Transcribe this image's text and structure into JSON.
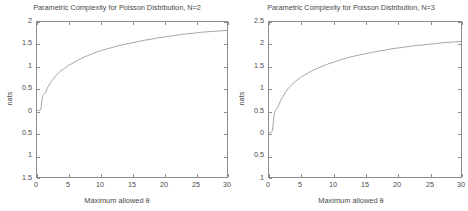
{
  "figure": {
    "background": "#ffffff",
    "axis_color": "#8d8d8d",
    "line_color": "#9a9a9a",
    "text_color": "#4a4a4a"
  },
  "panels": [
    {
      "title": "Parametric Complexity for Poisson Distribution, N=2",
      "xlabel": "Maximum allowed θ",
      "ylabel": "nats",
      "xticks": [
        "0",
        "5",
        "10",
        "15",
        "20",
        "25",
        "30"
      ],
      "yticks": [
        "2",
        "1.5",
        "1",
        "0.5",
        "0",
        "0.5",
        "1",
        "1.5"
      ]
    },
    {
      "title": "Parametric Complexity for Poisson Distribution, N=3",
      "xlabel": "Maximum allowed θ",
      "ylabel": "nats",
      "xticks": [
        "0",
        "5",
        "10",
        "15",
        "20",
        "25",
        "30"
      ],
      "yticks": [
        "2.5",
        "2",
        "1.5",
        "1",
        "0.5",
        "0",
        "0.5",
        "1"
      ]
    }
  ],
  "chart_data": [
    {
      "type": "line",
      "title": "Parametric Complexity for Poisson Distribution, N=2",
      "xlabel": "Maximum allowed θ",
      "ylabel": "nats",
      "xlim": [
        0,
        30
      ],
      "ylim": [
        -1.5,
        2
      ],
      "xticks": [
        0,
        5,
        10,
        15,
        20,
        25,
        30
      ],
      "yticks": [
        2,
        1.5,
        1,
        0.5,
        0,
        -0.5,
        -1,
        -1.5
      ],
      "grid": false,
      "legend": "none",
      "series": [
        {
          "name": "N=2",
          "x": [
            0,
            0.3,
            0.6,
            0.75,
            0.9,
            1.0,
            1.2,
            1.4,
            1.6,
            1.8,
            2.0,
            2.3,
            2.6,
            3.0,
            3.4,
            3.8,
            4.2,
            4.6,
            5.0,
            5.5,
            6.0,
            6.5,
            7.0,
            7.5,
            8.0,
            9.0,
            10.0,
            11.0,
            12.0,
            13.0,
            14.0,
            15.0,
            16.0,
            17.0,
            18.0,
            19.0,
            20.0,
            21.0,
            22.0,
            23.0,
            24.0,
            25.0,
            26.0,
            27.0,
            28.0,
            29.0,
            30.0
          ],
          "y": [
            0,
            0,
            0.02,
            0.2,
            0.34,
            0.36,
            0.38,
            0.42,
            0.5,
            0.55,
            0.6,
            0.66,
            0.72,
            0.79,
            0.85,
            0.9,
            0.94,
            0.98,
            1.02,
            1.06,
            1.1,
            1.14,
            1.18,
            1.21,
            1.24,
            1.3,
            1.35,
            1.39,
            1.43,
            1.47,
            1.5,
            1.53,
            1.56,
            1.59,
            1.61,
            1.64,
            1.66,
            1.68,
            1.7,
            1.72,
            1.74,
            1.75,
            1.77,
            1.78,
            1.79,
            1.8,
            1.81
          ]
        }
      ]
    },
    {
      "type": "line",
      "title": "Parametric Complexity for Poisson Distribution, N=3",
      "xlabel": "Maximum allowed θ",
      "ylabel": "nats",
      "xlim": [
        0,
        30
      ],
      "ylim": [
        -1,
        2.5
      ],
      "xticks": [
        0,
        5,
        10,
        15,
        20,
        25,
        30
      ],
      "yticks": [
        2.5,
        2,
        1.5,
        1,
        0.5,
        0,
        -0.5,
        -1
      ],
      "grid": false,
      "legend": "none",
      "series": [
        {
          "name": "N=3",
          "x": [
            0,
            0.3,
            0.55,
            0.7,
            0.85,
            1.0,
            1.2,
            1.4,
            1.6,
            1.8,
            2.0,
            2.3,
            2.6,
            3.0,
            3.4,
            3.8,
            4.2,
            4.6,
            5.0,
            5.5,
            6.0,
            6.5,
            7.0,
            7.5,
            8.0,
            9.0,
            10.0,
            11.0,
            12.0,
            13.0,
            14.0,
            15.0,
            16.0,
            17.0,
            18.0,
            19.0,
            20.0,
            21.0,
            22.0,
            23.0,
            24.0,
            25.0,
            26.0,
            27.0,
            28.0,
            29.0,
            30.0
          ],
          "y": [
            0,
            0,
            0.05,
            0.28,
            0.45,
            0.5,
            0.54,
            0.58,
            0.65,
            0.72,
            0.78,
            0.85,
            0.92,
            1.0,
            1.06,
            1.12,
            1.17,
            1.21,
            1.25,
            1.3,
            1.34,
            1.38,
            1.42,
            1.45,
            1.48,
            1.54,
            1.59,
            1.64,
            1.68,
            1.72,
            1.75,
            1.78,
            1.81,
            1.84,
            1.86,
            1.89,
            1.91,
            1.93,
            1.95,
            1.97,
            1.98,
            2.0,
            2.01,
            2.03,
            2.04,
            2.05,
            2.06
          ]
        }
      ]
    }
  ]
}
